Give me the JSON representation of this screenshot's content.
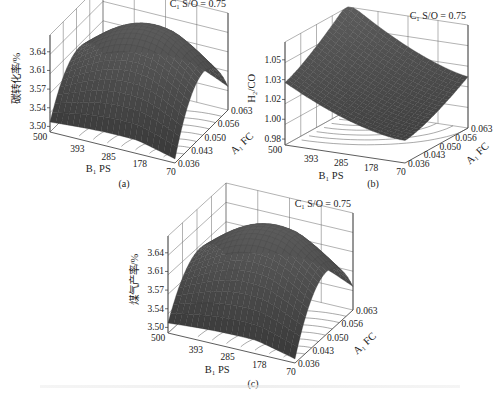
{
  "chart_data": [
    {
      "id": "a",
      "type": "surface3d",
      "caption": "(a)",
      "condition": "C₁ S/O = 0.75",
      "zlabel": "碳转化率/%",
      "xlabel": "B₁ PS",
      "ylabel": "A₁ FC",
      "x_ticks": [
        "500",
        "393",
        "285",
        "178",
        "70"
      ],
      "y_ticks": [
        "0.036",
        "0.043",
        "0.050",
        "0.056",
        "0.063"
      ],
      "z_ticks": [
        "3.50",
        "3.54",
        "3.57",
        "3.61",
        "3.64"
      ],
      "zlim": [
        3.48,
        3.66
      ],
      "surface_shape": "ridge",
      "grid": true,
      "contours_on_floor": true
    },
    {
      "id": "b",
      "type": "surface3d",
      "caption": "(b)",
      "condition": "C₁ S/O = 0.75",
      "zlabel": "H₂/CO",
      "xlabel": "B₁ PS",
      "ylabel": "A₁ FC",
      "x_ticks": [
        "500",
        "393",
        "285",
        "178",
        "70"
      ],
      "y_ticks": [
        "0.036",
        "0.043",
        "0.050",
        "0.056",
        "0.063"
      ],
      "z_ticks": [
        "0.98",
        "1.00",
        "1.02",
        "1.03",
        "1.05"
      ],
      "zlim": [
        0.97,
        1.06
      ],
      "surface_shape": "bowl",
      "grid": true,
      "contours_on_floor": true
    },
    {
      "id": "c",
      "type": "surface3d",
      "caption": "(c)",
      "condition": "C₁ S/O = 0.75",
      "zlabel": "煤气产率/%",
      "xlabel": "B₁ PS",
      "ylabel": "A₁ FC",
      "x_ticks": [
        "500",
        "393",
        "285",
        "178",
        "70"
      ],
      "y_ticks": [
        "0.036",
        "0.043",
        "0.050",
        "0.056",
        "0.063"
      ],
      "z_ticks": [
        "3.50",
        "3.54",
        "3.57",
        "3.61",
        "3.64"
      ],
      "zlim": [
        3.48,
        3.66
      ],
      "surface_shape": "ridge",
      "grid": true,
      "contours_on_floor": true
    }
  ],
  "panels": {
    "a": {
      "caption": "(a)"
    },
    "b": {
      "caption": "(b)"
    },
    "c": {
      "caption": "(c)"
    }
  }
}
